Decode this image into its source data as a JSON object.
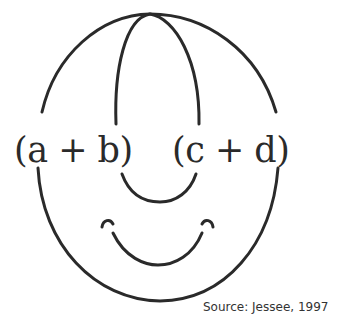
{
  "figure": {
    "type": "smiley-face diagram formed by algebraic expressions",
    "left_expression": "(a + b)",
    "right_expression": "(c + d)",
    "caption": "Source: Jessee, 1997",
    "stroke_color": "#2a2a2a",
    "background_color": "#ffffff"
  }
}
